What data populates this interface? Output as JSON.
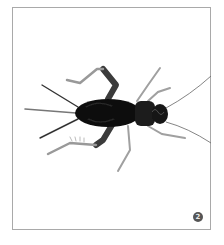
{
  "figure": {
    "badge_number": "2",
    "colors": {
      "frame_border": "#a9a9a9",
      "background": "#ffffff",
      "body": "#111111",
      "legs": "#8a8a8a",
      "badge": "#555555"
    }
  }
}
